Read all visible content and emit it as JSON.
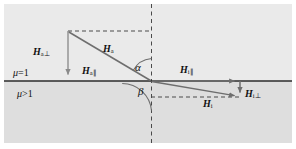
{
  "figure": {
    "type": "physics-vector-diagram",
    "colors": {
      "page_background": "#ffffff",
      "panel_upper": "#eaeaea",
      "panel_lower": "#dedede",
      "interface_line": "#2b2b2b",
      "vector_line": "#707070",
      "dashed_line": "#555555",
      "text": "#111111"
    }
  },
  "media_labels": {
    "upper": {
      "mu": "μ",
      "relation": "=1",
      "full": "μ=1"
    },
    "lower": {
      "mu": "μ",
      "relation": ">1",
      "full": "μ>1"
    }
  },
  "vectors": [
    {
      "id": "H_a_perp",
      "symbol": "H",
      "subscript": "a⊥",
      "label": "Ha⊥",
      "orientation": "vertical-down",
      "side": "upper-left",
      "from": [
        68,
        31
      ],
      "to": [
        68,
        81
      ]
    },
    {
      "id": "H_a",
      "symbol": "H",
      "subscript": "a",
      "label": "Ha",
      "orientation": "diagonal-down-right",
      "side": "upper",
      "from": [
        68,
        31
      ],
      "to": [
        151,
        81
      ]
    },
    {
      "id": "H_a_par",
      "symbol": "H",
      "subscript": "a∥",
      "label": "Ha∥",
      "orientation": "horizontal-right",
      "side": "upper-interface",
      "from": [
        68,
        81
      ],
      "to": [
        151,
        81
      ]
    },
    {
      "id": "H_i_par",
      "symbol": "H",
      "subscript": "i∥",
      "label": "Hi∥",
      "orientation": "horizontal-right",
      "side": "lower-interface",
      "from": [
        151,
        81
      ],
      "to": [
        240,
        81
      ]
    },
    {
      "id": "H_i_perp",
      "symbol": "H",
      "subscript": "i⊥",
      "label": "Hi⊥",
      "orientation": "vertical-down",
      "side": "lower-right",
      "from": [
        240,
        81
      ],
      "to": [
        240,
        97
      ]
    },
    {
      "id": "H_i",
      "symbol": "H",
      "subscript": "i",
      "label": "Hi",
      "orientation": "diagonal-down-right",
      "side": "lower",
      "from": [
        151,
        81
      ],
      "to": [
        240,
        97
      ]
    }
  ],
  "angles": [
    {
      "id": "alpha",
      "label": "α",
      "vertex": [
        151,
        81
      ],
      "between": [
        "H_a",
        "normal-up"
      ],
      "region": "upper"
    },
    {
      "id": "beta",
      "label": "β",
      "vertex": [
        151,
        81
      ],
      "between": [
        "H_i",
        "normal-down"
      ],
      "region": "lower"
    }
  ],
  "guides": {
    "normal_dashed_vertical": {
      "x": 151,
      "from_y": 4,
      "to_y": 143
    },
    "top_dashed_horizontal": {
      "y": 31,
      "from_x": 68,
      "to_x": 151
    },
    "lower_dashed_horizontal": {
      "y": 97,
      "from_x": 151,
      "to_x": 240
    },
    "interface_solid": {
      "y": 81,
      "from_x": 4,
      "to_x": 292
    }
  }
}
